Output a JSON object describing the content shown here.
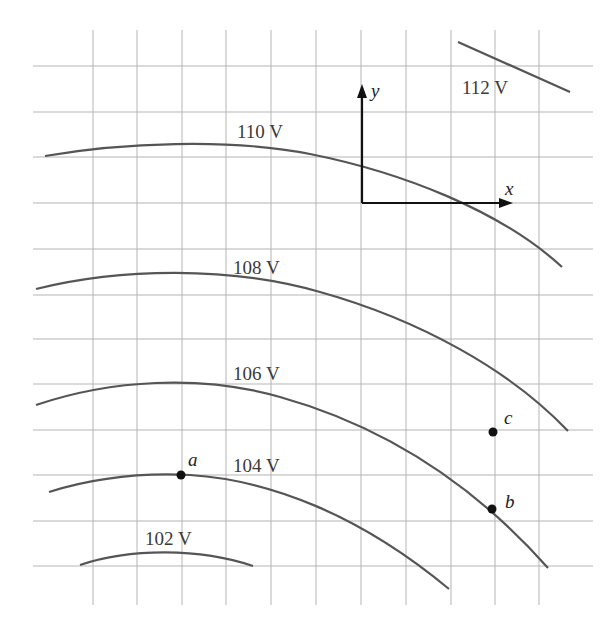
{
  "diagram": {
    "type": "equipotential-lines",
    "grid": {
      "vertical_x": [
        93,
        137,
        182,
        226,
        271,
        316,
        361,
        406,
        451,
        495,
        539
      ],
      "horizontal_y": [
        66,
        112,
        157,
        203,
        249,
        295,
        339,
        384,
        430,
        475,
        521,
        566
      ],
      "x_start": 33,
      "x_end": 593,
      "y_start": 30,
      "y_end": 605,
      "color": "#b5b5b5"
    },
    "curve_color": "#555555",
    "equipotentials": [
      {
        "label": "112 V",
        "path": "M458,42 L570,92",
        "label_x": 462,
        "label_y": 94
      },
      {
        "label": "110 V",
        "path": "M45,156 C120,143 230,138 310,154 C400,172 500,210 562,267",
        "label_x": 237,
        "label_y": 138
      },
      {
        "label": "108 V",
        "path": "M36,289 C120,268 230,266 320,292 C420,320 510,370 568,431",
        "label_x": 233,
        "label_y": 274
      },
      {
        "label": "106 V",
        "path": "M36,405 C110,380 200,374 280,397 C380,425 470,480 548,568",
        "label_x": 233,
        "label_y": 380
      },
      {
        "label": "104 V",
        "path": "M49,492 C100,476 150,473 190,475 C270,480 360,515 449,589",
        "label_x": 233,
        "label_y": 472
      },
      {
        "label": "102 V",
        "path": "M80,565 C130,548 200,548 253,566",
        "label_x": 145,
        "label_y": 545
      }
    ],
    "points": [
      {
        "name": "a",
        "cx": 181,
        "cy": 475,
        "label_x": 188,
        "label_y": 466
      },
      {
        "name": "b",
        "cx": 492,
        "cy": 509,
        "label_x": 505,
        "label_y": 508
      },
      {
        "name": "c",
        "cx": 493,
        "cy": 432,
        "label_x": 504,
        "label_y": 424
      }
    ],
    "axes": {
      "origin": [
        362,
        203
      ],
      "x_tip": [
        513,
        203
      ],
      "y_tip": [
        362,
        84
      ],
      "x_label": "x",
      "y_label": "y"
    }
  }
}
